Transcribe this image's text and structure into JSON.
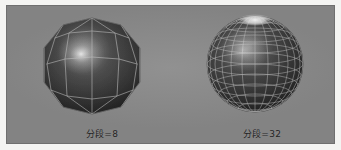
{
  "figure": {
    "background_color": "#f4f4f2",
    "panel_color": "#8b8b8b",
    "panel_border_color": "#6f6f6f",
    "wireframe_color": "#c9c9c9",
    "surface_color": "#2e2e2e",
    "highlight_color": "#ffffff",
    "caption_color": "#242424"
  },
  "viewports": [
    {
      "id": "left",
      "object_name": "faceted-sphere",
      "segments": 8,
      "caption": "分段=8",
      "center_x": 85,
      "center_y": 58,
      "radius": 46
    },
    {
      "id": "right",
      "object_name": "smooth-sphere",
      "segments": 32,
      "caption": "分段=32",
      "center_x": 92,
      "center_y": 58,
      "radius": 48
    }
  ]
}
